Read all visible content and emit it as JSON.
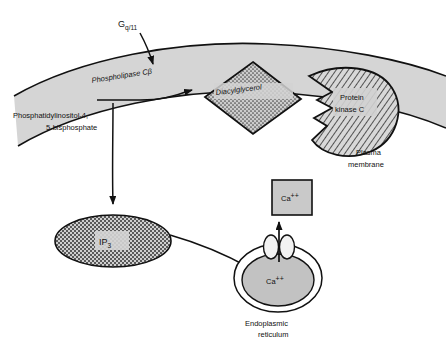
{
  "figure": {
    "colors": {
      "background": "#ffffff",
      "membrane_fill": "#d5d5d5",
      "stroke": "#111111",
      "diacylglycerol_fill": "#c9c9c9",
      "protein_kinase_fill": "#cfcfcf",
      "ip3_fill": "#b9b9b9",
      "er_fill": "#c2c2c2",
      "calcium_box_fill": "#c9c9c9",
      "label_plate": "#d9d9d9",
      "channel_fill": "#f2f2f2"
    }
  },
  "labels": {
    "g_protein": {
      "base": "G",
      "subscript": "q/11"
    },
    "phospholipase": "Phospholipase Cβ",
    "pip2_line1": "Phosphatidylinositol-4,",
    "pip2_line2": "5-bisphosphate",
    "diacylglycerol": "Diacylglycerol",
    "protein_kinase_line1": "Protein",
    "protein_kinase_line2": "kinase C",
    "plasma_membrane_line1": "Plasma",
    "plasma_membrane_line2": "membrane",
    "ip3": {
      "base": "IP",
      "subscript": "3"
    },
    "calcium_box": {
      "base": "Ca",
      "superscript": "++"
    },
    "calcium_er": {
      "base": "Ca",
      "superscript": "++"
    },
    "er_line1": "Endoplasmic",
    "er_line2": "reticulum"
  }
}
